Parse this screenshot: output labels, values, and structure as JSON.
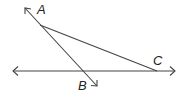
{
  "diagram": {
    "type": "geometry",
    "points": {
      "A": {
        "label": "A",
        "x": 40,
        "y": 25
      },
      "B": {
        "label": "B",
        "x": 96,
        "y": 85
      },
      "C": {
        "label": "C",
        "x": 157,
        "y": 71
      }
    },
    "elements": [
      {
        "kind": "line",
        "name": "horizontal-line",
        "from": [
          13,
          71
        ],
        "to": [
          175,
          71
        ],
        "arrows": "both"
      },
      {
        "kind": "ray",
        "name": "line-AB",
        "through": [
          "A",
          "B"
        ],
        "arrows": "both"
      },
      {
        "kind": "segment",
        "name": "segment-AC",
        "from": "A",
        "to": "C"
      }
    ],
    "colors": {
      "stroke": "#444444",
      "text": "#222222"
    }
  }
}
